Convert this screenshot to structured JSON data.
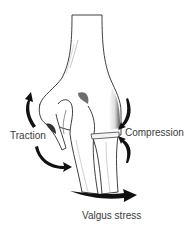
{
  "diagram": {
    "labels": {
      "traction": "Traction",
      "compression": "Compression",
      "valgus": "Valgus stress"
    },
    "structures": [
      "humerus",
      "medial-epicondyle",
      "ulna",
      "radius",
      "radiocapitellar-joint"
    ],
    "colors": {
      "outline": "#2a2a2a",
      "bone_fill": "#ffffff",
      "shading": "#6e6e6e",
      "arrow": "#111111",
      "text": "#3a3a3a"
    }
  }
}
